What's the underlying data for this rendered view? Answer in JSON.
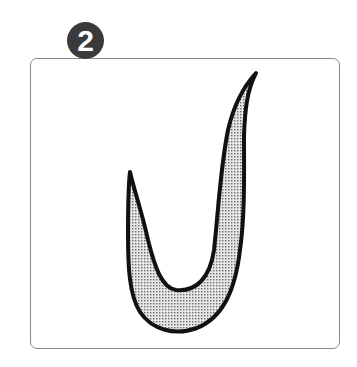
{
  "step": {
    "number": "2",
    "badge_color": "#3a3a3a",
    "badge_text_color": "#ffffff"
  },
  "card": {
    "border_color": "#8a8a8a",
    "background": "#ffffff"
  },
  "illustration": {
    "subject": "hook-shaped-curved-form",
    "fill_pattern": "dotted-halftone-grey",
    "outline_color": "#111111"
  }
}
